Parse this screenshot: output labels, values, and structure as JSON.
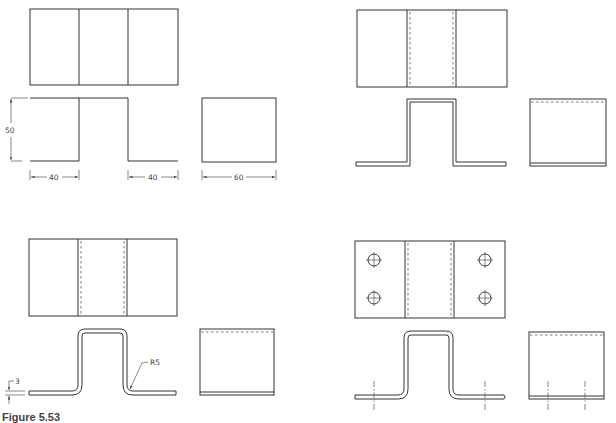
{
  "figure": {
    "caption": "Figure 5.53",
    "panels": [
      {
        "id": "step1",
        "description": "Basic outline: front view, top view and side view lines"
      },
      {
        "id": "step2",
        "description": "Thickness added with hidden bend lines"
      },
      {
        "id": "step3",
        "description": "Bend radii added"
      },
      {
        "id": "step4",
        "description": "Holes added with center lines"
      }
    ]
  },
  "dimensions": {
    "height": "50",
    "left_flange": "40",
    "right_flange": "40",
    "depth": "60",
    "thickness": "3",
    "bend_radius": "R5"
  },
  "colors": {
    "line": "#333333",
    "background": "#ffffff"
  }
}
